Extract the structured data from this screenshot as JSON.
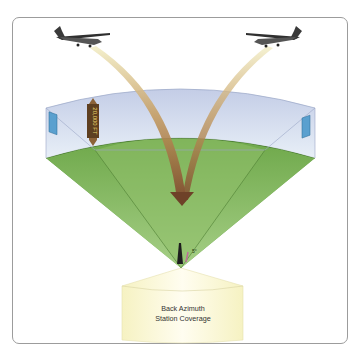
{
  "figure": {
    "caption_box": {
      "line1": "Back Azimuth",
      "line2": "Station Coverage"
    },
    "altitude_marker": "20,000 FT",
    "left_azimuth_label": "40°",
    "right_azimuth_label": "40°",
    "glide_angle_label": "5°",
    "aircraft": [
      {
        "name": "left-aircraft",
        "heading": "right"
      },
      {
        "name": "right-aircraft",
        "heading": "left"
      }
    ],
    "colors": {
      "frame_border": "#9c9c9c",
      "sky_volume": "#c9d3e8",
      "ground_top": "#7fb35a",
      "ground_side": "#5e9a3c",
      "arrow": "#8a5a3a",
      "coverage_box": "#fbf8d4",
      "azimuth_badge": "#5aa0cf",
      "altitude_badge": "#8b6238"
    }
  }
}
